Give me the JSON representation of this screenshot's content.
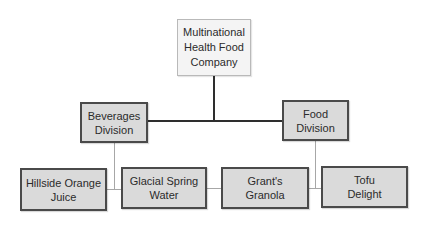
{
  "diagram": {
    "type": "org-chart",
    "root": {
      "label": "Multinational\nHealth Food\nCompany"
    },
    "divisions": [
      {
        "label": "Beverages\nDivision",
        "products": [
          {
            "label": "Hillside Orange\nJuice"
          },
          {
            "label": "Glacial Spring\nWater"
          }
        ]
      },
      {
        "label": "Food\nDivision",
        "products": [
          {
            "label": "Grant's\nGranola"
          },
          {
            "label": "Tofu\nDelight"
          }
        ]
      }
    ],
    "colors": {
      "root_fill": "#f4f4f4",
      "root_border": "#b9b9b9",
      "box_fill": "#dadada",
      "box_border": "#4a4a4a",
      "upper_connector": "#2e2e2e",
      "lower_connector": "#a7a7a7"
    }
  }
}
